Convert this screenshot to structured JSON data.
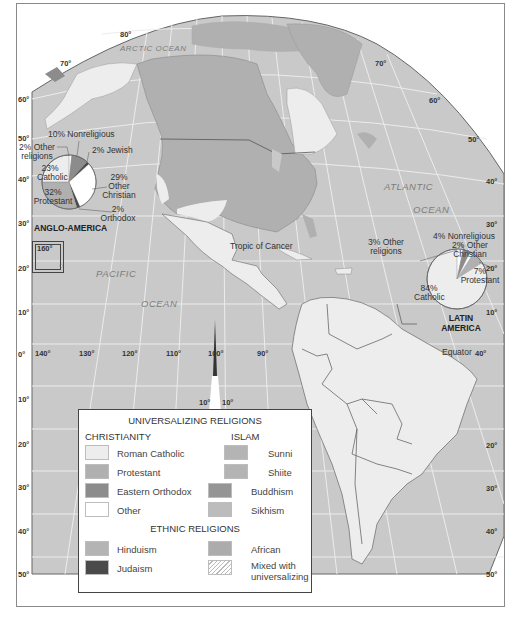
{
  "map": {
    "colors": {
      "ocean": "#c9c9c9",
      "graticule": "#ececec",
      "roman_catholic": "#ededed",
      "protestant": "#b0b0b0",
      "eastern_orthodox": "#8c8c8c",
      "other": "#ffffff",
      "sunni": "#b4b4b4",
      "shiite": "#b4b4b4",
      "buddhism": "#959595",
      "sikhism": "#bcbcbc",
      "hinduism": "#b4b4b4",
      "judaism": "#4a4a4a",
      "african": "#acacac",
      "mixed": "hatched",
      "border": "#555555"
    },
    "oceans": {
      "arctic": "ARCTIC OCEAN",
      "atlantic_1": "ATLANTIC",
      "atlantic_2": "OCEAN",
      "pacific_1": "PACIFIC",
      "pacific_2": "OCEAN"
    },
    "lines": {
      "tropic": "Tropic of Cancer",
      "equator": "Equator"
    },
    "latitude_labels_left": [
      "80°",
      "70°",
      "60°",
      "50°",
      "40°",
      "30°",
      "20°",
      "10°",
      "0°",
      "10°",
      "20°",
      "30°",
      "40°",
      "50°"
    ],
    "latitude_labels_right": [
      "70°",
      "60°",
      "50°",
      "40°",
      "30°",
      "20°",
      "10°",
      "20°",
      "30°",
      "40°",
      "50°"
    ],
    "longitude_labels": [
      "140°",
      "130°",
      "120°",
      "110°",
      "100°",
      "90°",
      "40°"
    ],
    "inset_label": "160°",
    "wedge_labels": [
      "10°",
      "10°"
    ]
  },
  "pies": {
    "anglo_america": {
      "title": "ANGLO-AMERICA",
      "slices": [
        {
          "label": "Catholic",
          "pct": 23
        },
        {
          "label": "Protestant",
          "pct": 32
        },
        {
          "label": "Orthodox",
          "pct": 2
        },
        {
          "label": "Other Christian",
          "pct": 29
        },
        {
          "label": "Jewish",
          "pct": 2
        },
        {
          "label": "Nonreligious",
          "pct": 10
        },
        {
          "label": "Other religions",
          "pct": 2
        }
      ],
      "text": {
        "nonreligious": "10% Nonreligious",
        "other_rel_1": "2% Other",
        "other_rel_2": "religions",
        "jewish": "2% Jewish",
        "catholic_1": "23%",
        "catholic_2": "Catholic",
        "protestant_1": "32%",
        "protestant_2": "Protestant",
        "other_chr_1": "29%",
        "other_chr_2": "Other",
        "other_chr_3": "Christian",
        "orthodox_1": "2%",
        "orthodox_2": "Orthodox"
      }
    },
    "latin_america": {
      "title_1": "LATIN",
      "title_2": "AMERICA",
      "slices": [
        {
          "label": "Catholic",
          "pct": 84
        },
        {
          "label": "Other religions",
          "pct": 3
        },
        {
          "label": "Nonreligious",
          "pct": 4
        },
        {
          "label": "Other Christian",
          "pct": 2
        },
        {
          "label": "Protestant",
          "pct": 7
        }
      ],
      "text": {
        "other_rel_1": "3% Other",
        "other_rel_2": "religions",
        "nonreligious": "4% Nonreligious",
        "other_chr_1": "2% Other",
        "other_chr_2": "Christian",
        "protestant_1": "7%",
        "protestant_2": "Protestant",
        "catholic_1": "84%",
        "catholic_2": "Catholic"
      }
    }
  },
  "legend": {
    "universalizing": "UNIVERSALIZING RELIGIONS",
    "christianity": "CHRISTIANITY",
    "islam": "ISLAM",
    "ethnic": "ETHNIC RELIGIONS",
    "items": {
      "roman_catholic": "Roman Catholic",
      "protestant": "Protestant",
      "eastern_orthodox": "Eastern Orthodox",
      "other": "Other",
      "sunni": "Sunni",
      "shiite": "Shiite",
      "buddhism": "Buddhism",
      "sikhism": "Sikhism",
      "hinduism": "Hinduism",
      "judaism": "Judaism",
      "african": "African",
      "mixed_1": "Mixed with",
      "mixed_2": "universalizing"
    }
  }
}
